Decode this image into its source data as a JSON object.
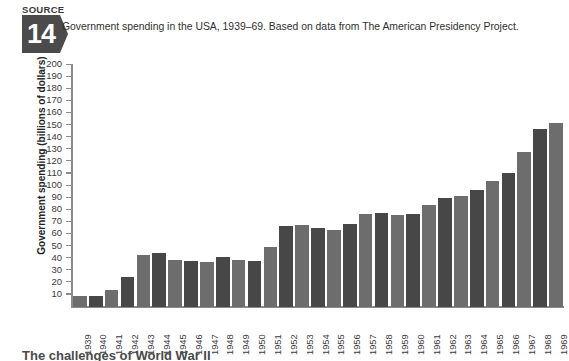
{
  "source_badge": {
    "label": "SOURCE",
    "number": "14"
  },
  "header": {
    "title": "Government spending in the USA, 1939–69. Based on data from The American Presidency Project."
  },
  "colors": {
    "bar_light": "#6d6d6d",
    "bar_dark": "#474747",
    "axis": "#8a8a8a",
    "text": "#3b3b3b",
    "badge": "#4b4b4b"
  },
  "chart_data": {
    "type": "bar",
    "title": "Government spending in the USA, 1939–69. Based on data from The American Presidency Project.",
    "xlabel": "",
    "ylabel": "Government spending (billions of dollars)",
    "ylim": [
      0,
      200
    ],
    "ytick_labels": [
      "200",
      "190",
      "180",
      "170",
      "160",
      "150",
      "140",
      "130",
      "120",
      "110",
      "100",
      "90",
      "80",
      "70",
      "60",
      "50",
      "40",
      "30",
      "20",
      "10"
    ],
    "yticks": [
      200,
      190,
      180,
      170,
      160,
      150,
      140,
      130,
      120,
      110,
      100,
      90,
      80,
      70,
      60,
      50,
      40,
      30,
      20,
      10
    ],
    "grid": false,
    "legend": "none",
    "categories": [
      "1939",
      "1940",
      "1941",
      "1942",
      "1943",
      "1944",
      "1945",
      "1946",
      "1947",
      "1948",
      "1949",
      "1950",
      "1951",
      "1952",
      "1953",
      "1954",
      "1955",
      "1956",
      "1957",
      "1958",
      "1959",
      "1960",
      "1961",
      "1962",
      "1963",
      "1964",
      "1965",
      "1966",
      "1967",
      "1968",
      "1969"
    ],
    "values": [
      9,
      9,
      14,
      25,
      43,
      45,
      39,
      38,
      37,
      41,
      39,
      38,
      50,
      67,
      68,
      65,
      64,
      69,
      77,
      78,
      76,
      77,
      84,
      90,
      92,
      97,
      104,
      111,
      128,
      147,
      152
    ],
    "series": [
      {
        "name": "Government spending (billions of dollars)",
        "values": [
          9,
          9,
          14,
          25,
          43,
          45,
          39,
          38,
          37,
          41,
          39,
          38,
          50,
          67,
          68,
          65,
          64,
          69,
          77,
          78,
          76,
          77,
          84,
          90,
          92,
          97,
          104,
          111,
          128,
          147,
          152
        ]
      }
    ]
  },
  "bottom_strip": {
    "text": "The challenges of World War II"
  }
}
